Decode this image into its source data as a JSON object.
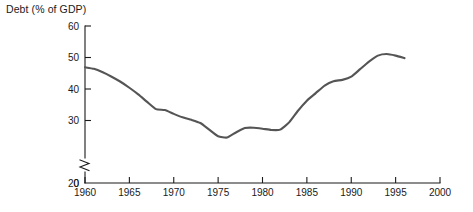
{
  "chart_data": {
    "type": "line",
    "title": "Debt (% of GDP)",
    "xlabel": "",
    "ylabel": "Debt (% of GDP)",
    "xlim": [
      1960,
      2000
    ],
    "ylim": [
      20,
      60
    ],
    "y_axis_break": true,
    "y_axis_break_label": "0",
    "grid": false,
    "legend": "none",
    "line_color": "#555555",
    "axis_color": "#1a1a1a",
    "background_color": "#ffffff",
    "x_ticks": [
      1960,
      1965,
      1970,
      1975,
      1980,
      1985,
      1990,
      1995,
      2000
    ],
    "x_tick_labels": [
      "1960",
      "1965",
      "1970",
      "1975",
      "1980",
      "1985",
      "1990",
      "1995",
      "2000"
    ],
    "y_ticks": [
      0,
      20,
      30,
      40,
      50,
      60
    ],
    "y_tick_labels": [
      "0",
      "20",
      "30",
      "40",
      "50",
      "60"
    ],
    "series": [
      {
        "name": "Debt (% of GDP)",
        "x": [
          1960,
          1961,
          1962,
          1963,
          1964,
          1965,
          1966,
          1967,
          1968,
          1969,
          1970,
          1971,
          1972,
          1973,
          1974,
          1975,
          1976,
          1977,
          1978,
          1979,
          1980,
          1981,
          1982,
          1983,
          1984,
          1985,
          1986,
          1987,
          1988,
          1989,
          1990,
          1991,
          1992,
          1993,
          1994,
          1995,
          1996
        ],
        "values": [
          46.9,
          46.4,
          45.3,
          43.9,
          42.3,
          40.4,
          38.3,
          35.9,
          33.6,
          33.3,
          32.1,
          31.0,
          30.2,
          29.2,
          27.1,
          25.0,
          24.6,
          26.2,
          27.6,
          27.7,
          27.4,
          27.0,
          27.1,
          29.4,
          33.1,
          36.3,
          38.7,
          41.1,
          42.5,
          42.9,
          43.9,
          46.3,
          48.7,
          50.6,
          51.1,
          50.6,
          49.8
        ]
      }
    ],
    "annotations": []
  },
  "figure": {
    "title_text": "Debt (% of GDP)",
    "caption_text": ""
  }
}
